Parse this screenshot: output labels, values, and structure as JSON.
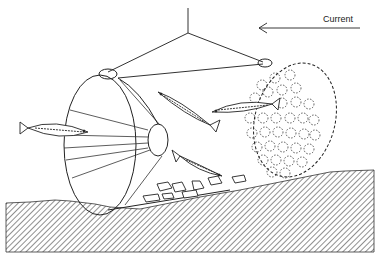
{
  "diagram": {
    "type": "illustration",
    "labels": {
      "current": "Current"
    },
    "elements": [
      {
        "name": "suspension-rope",
        "description": "vertical rope with bridle lines"
      },
      {
        "name": "funnel-entrance",
        "description": "conical net funnel on left"
      },
      {
        "name": "perforated-end-disc",
        "description": "circular end panel with dotted holes on right"
      },
      {
        "name": "fish",
        "count": 4
      },
      {
        "name": "bait-stones",
        "count": 8
      },
      {
        "name": "seabed",
        "description": "hatched sloping sea floor"
      },
      {
        "name": "current-arrow",
        "direction": "left"
      }
    ],
    "colors": {
      "ink": "#222222",
      "background": "#ffffff"
    }
  }
}
